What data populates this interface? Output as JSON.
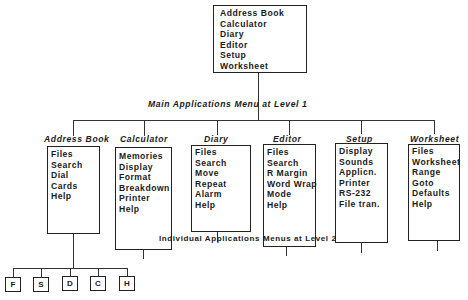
{
  "level1": {
    "items": [
      "Address Book",
      "Calculator",
      "Diary",
      "Editor",
      "Setup",
      "Worksheet"
    ],
    "caption": "Main Applications Menu at Level 1"
  },
  "level2": {
    "caption": "Individual Applications Menus at Level 2",
    "menus": [
      {
        "title": "Address Book",
        "items": [
          "Files",
          "Search",
          "Dial",
          "Cards",
          "Help"
        ]
      },
      {
        "title": "Calculator",
        "items": [
          "Memories",
          "Display",
          "Format",
          "Breakdown",
          "Printer",
          "Help"
        ]
      },
      {
        "title": "Diary",
        "items": [
          "Files",
          "Search",
          "Move",
          "Repeat",
          "Alarm",
          "Help"
        ]
      },
      {
        "title": "Editor",
        "items": [
          "Files",
          "Search",
          "R Margin",
          "Word Wrap",
          "Mode",
          "Help"
        ]
      },
      {
        "title": "Setup",
        "items": [
          "Display",
          "Sounds",
          "Applicn.",
          "Printer",
          "RS-232",
          "File tran."
        ]
      },
      {
        "title": "Worksheet",
        "items": [
          "Files",
          "Worksheet",
          "Range",
          "Goto",
          "Defaults",
          "Help"
        ]
      }
    ]
  },
  "level3": {
    "parent": "Address Book",
    "boxes": [
      "F",
      "S",
      "D",
      "C",
      "H"
    ]
  }
}
